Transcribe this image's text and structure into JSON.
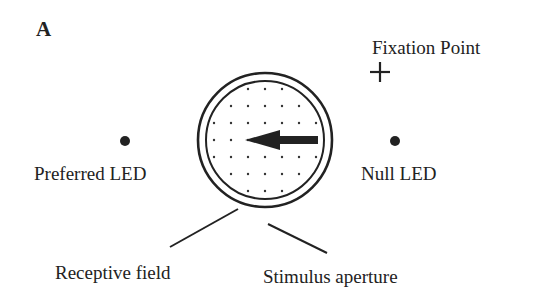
{
  "figure": {
    "panel_label": "A",
    "labels": {
      "fixation_point": "Fixation Point",
      "preferred_led": "Preferred LED",
      "null_led": "Null LED",
      "receptive_field": "Receptive field",
      "stimulus_aperture": "Stimulus aperture"
    },
    "motion_direction": "leftward",
    "colors": {
      "ink": "#222222",
      "background": "#ffffff"
    }
  }
}
